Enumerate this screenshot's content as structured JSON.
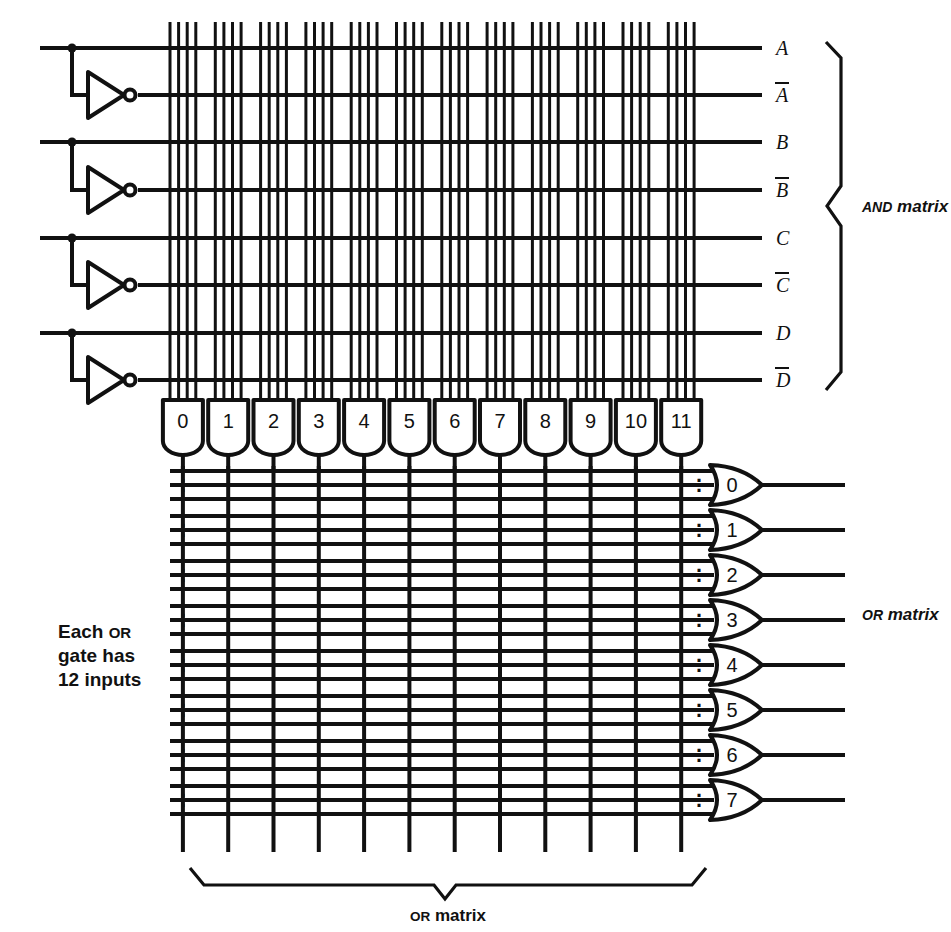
{
  "diagram": {
    "title_visible": false,
    "kind": "pla-pal-and-or-matrix",
    "colors": {
      "ink": "#111111",
      "background": "#ffffff"
    }
  },
  "inputs": {
    "names": [
      "A",
      "B",
      "C",
      "D"
    ],
    "labels": [
      {
        "name": "A",
        "text": "A",
        "overbar": false
      },
      {
        "name": "A-bar",
        "text": "A",
        "overbar": true
      },
      {
        "name": "B",
        "text": "B",
        "overbar": false
      },
      {
        "name": "B-bar",
        "text": "B",
        "overbar": true
      },
      {
        "name": "C",
        "text": "C",
        "overbar": false
      },
      {
        "name": "C-bar",
        "text": "C",
        "overbar": true
      },
      {
        "name": "D",
        "text": "D",
        "overbar": false
      },
      {
        "name": "D-bar",
        "text": "D",
        "overbar": true
      }
    ],
    "inverter_count": 4
  },
  "and_gates": {
    "count": 12,
    "inputs_each": 4,
    "labels": [
      "0",
      "1",
      "2",
      "3",
      "4",
      "5",
      "6",
      "7",
      "8",
      "9",
      "10",
      "11"
    ]
  },
  "or_gates": {
    "count": 8,
    "labels": [
      "0",
      "1",
      "2",
      "3",
      "4",
      "5",
      "6",
      "7"
    ],
    "shown_input_lines_each": 3,
    "ellipsis_glyph": "⋮"
  },
  "annotations": {
    "and_matrix_label": {
      "lead": "AND",
      "rest": " matrix"
    },
    "or_matrix_label_right": {
      "lead": "OR",
      "rest": " matrix"
    },
    "or_matrix_label_bottom": {
      "lead": "OR",
      "rest": " matrix"
    },
    "note_left": {
      "line1_lead": "Each ",
      "line1_sc": "OR",
      "line2": "gate has",
      "line3": "12 inputs"
    }
  }
}
